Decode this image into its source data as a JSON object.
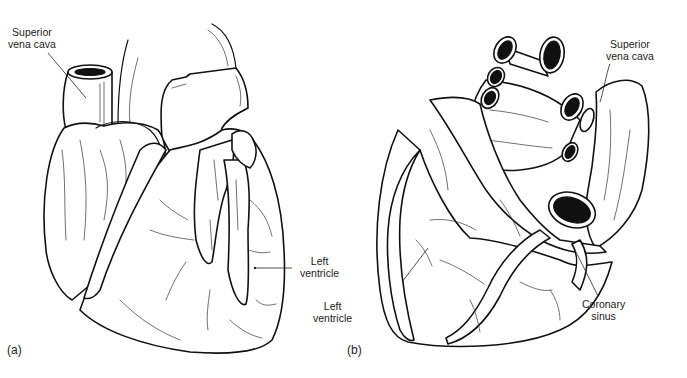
{
  "figure": {
    "panels": [
      {
        "id": "a",
        "letter": "(a)",
        "labels": [
          {
            "line1": "Superior",
            "line2": "vena cava"
          },
          {
            "line1": "Left",
            "line2": "ventricle"
          }
        ]
      },
      {
        "id": "b",
        "letter": "(b)",
        "labels": [
          {
            "line1": "Superior",
            "line2": "vena cava"
          },
          {
            "line1": "Left",
            "line2": "ventricle"
          },
          {
            "line1": "Coronary",
            "line2": "sinus"
          }
        ]
      }
    ]
  }
}
